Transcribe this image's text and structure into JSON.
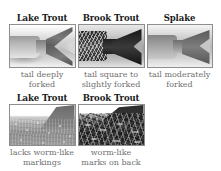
{
  "figure": {
    "background_color": "#ffffff",
    "title_color": "#1a1a1a",
    "caption_color": "#6f6f6f",
    "photo_border_color": "#8e8e8e"
  },
  "rows": [
    {
      "id": "tail-shape",
      "cells": [
        {
          "title": "Lake Trout",
          "caption": "tail deeply\nforked",
          "photo_name": "lake-trout-tail-photo"
        },
        {
          "title": "Brook Trout",
          "caption": "tail square to\nslightly forked",
          "photo_name": "brook-trout-tail-photo"
        },
        {
          "title": "Splake",
          "caption": "tail moderately\nforked",
          "photo_name": "splake-tail-photo"
        }
      ]
    },
    {
      "id": "back-markings",
      "cells": [
        {
          "title": "Lake Trout",
          "caption": "lacks worm-like\nmarkings",
          "photo_name": "lake-trout-back-photo"
        },
        {
          "title": "Brook Trout",
          "caption": "worm-like\nmarks on back",
          "photo_name": "brook-trout-back-photo"
        }
      ]
    }
  ]
}
